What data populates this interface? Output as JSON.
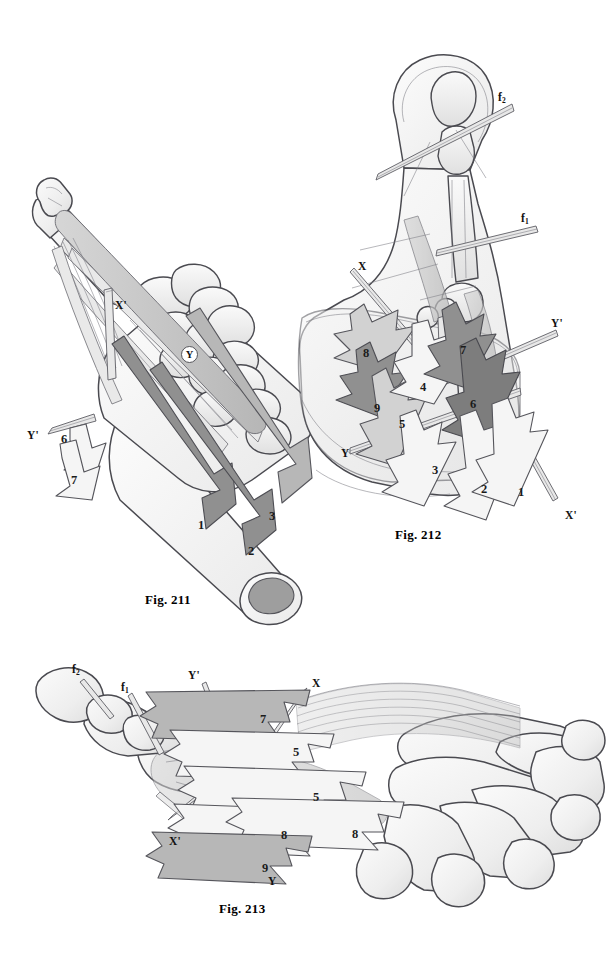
{
  "plate": {
    "background": "#ffffff",
    "ink": "#3a3a40",
    "palette": {
      "bone_fill": "#f2f2f2",
      "bone_shade": "#dcdcdc",
      "arrow_light": "#f4f4f4",
      "arrow_mid": "#cfcfcf",
      "arrow_grey": "#b4b4b4",
      "arrow_dark": "#8d8d8d",
      "arrow_darkest": "#7a7a7a",
      "tendon": "#e3e3e3",
      "outline": "#4a4a50",
      "pin": "#6f6f75"
    }
  },
  "figures": [
    {
      "id": "fig-211",
      "caption": "Fig. 211",
      "caption_pos": {
        "x": 145,
        "y": 592
      },
      "view": "dorsal oblique view of hand / metacarpal column with muscle force vectors",
      "axis_labels": [
        {
          "name": "X'",
          "text": "X'",
          "x": 115,
          "y": 300,
          "style": "plain"
        },
        {
          "name": "Y",
          "text": "Y",
          "x": 181,
          "y": 346,
          "style": "circled"
        },
        {
          "name": "Y'",
          "text": "Y'",
          "x": 27,
          "y": 430,
          "style": "plain"
        }
      ],
      "force_arrows": [
        {
          "label": "1",
          "x": 198,
          "y": 519,
          "tone": "arrow_dark"
        },
        {
          "label": "2",
          "x": 248,
          "y": 545,
          "tone": "arrow_dark"
        },
        {
          "label": "3",
          "x": 269,
          "y": 510,
          "tone": "arrow_grey"
        },
        {
          "label": "6",
          "x": 61,
          "y": 433,
          "tone": "arrow_light"
        },
        {
          "label": "7",
          "x": 71,
          "y": 474,
          "tone": "arrow_light"
        }
      ]
    },
    {
      "id": "fig-212",
      "caption": "Fig. 212",
      "caption_pos": {
        "x": 395,
        "y": 527
      },
      "view": "palmar view of thumb column showing nine force vectors and two rotation pins",
      "axis_labels": [
        {
          "name": "f2",
          "text": "f",
          "sub": "2",
          "x": 498,
          "y": 92,
          "style": "sub"
        },
        {
          "name": "f1",
          "text": "f",
          "sub": "1",
          "x": 521,
          "y": 213,
          "style": "sub"
        },
        {
          "name": "X",
          "text": "X",
          "x": 358,
          "y": 261,
          "style": "plain"
        },
        {
          "name": "Y'",
          "text": "Y'",
          "x": 551,
          "y": 318,
          "style": "plain"
        },
        {
          "name": "Y",
          "text": "Y",
          "x": 341,
          "y": 448,
          "style": "plain"
        },
        {
          "name": "X'",
          "text": "X'",
          "x": 565,
          "y": 510,
          "style": "plain"
        }
      ],
      "force_arrows": [
        {
          "label": "1",
          "x": 518,
          "y": 486,
          "tone": "arrow_light"
        },
        {
          "label": "2",
          "x": 481,
          "y": 483,
          "tone": "arrow_light"
        },
        {
          "label": "3",
          "x": 432,
          "y": 464,
          "tone": "arrow_light"
        },
        {
          "label": "4",
          "x": 420,
          "y": 381,
          "tone": "arrow_light"
        },
        {
          "label": "5",
          "x": 399,
          "y": 418,
          "tone": "arrow_mid"
        },
        {
          "label": "6",
          "x": 470,
          "y": 398,
          "tone": "arrow_darkest"
        },
        {
          "label": "7",
          "x": 460,
          "y": 344,
          "tone": "arrow_dark"
        },
        {
          "label": "8",
          "x": 363,
          "y": 347,
          "tone": "arrow_mid"
        },
        {
          "label": "9",
          "x": 374,
          "y": 402,
          "tone": "arrow_dark"
        }
      ]
    },
    {
      "id": "fig-213",
      "caption": "Fig. 213",
      "caption_pos": {
        "x": 219,
        "y": 901
      },
      "view": "distal oblique view of metacarpal arch with thumb column vectors",
      "axis_labels": [
        {
          "name": "f2",
          "text": "f",
          "sub": "2",
          "x": 72,
          "y": 664,
          "style": "sub"
        },
        {
          "name": "f1",
          "text": "f",
          "sub": "1",
          "x": 121,
          "y": 682,
          "style": "sub"
        },
        {
          "name": "Y'",
          "text": "Y'",
          "x": 188,
          "y": 670,
          "style": "plain"
        },
        {
          "name": "X",
          "text": "X",
          "x": 312,
          "y": 678,
          "style": "plain"
        },
        {
          "name": "X'",
          "text": "X'",
          "x": 169,
          "y": 836,
          "style": "plain"
        },
        {
          "name": "Y",
          "text": "Y",
          "x": 268,
          "y": 876,
          "style": "plain"
        }
      ],
      "force_arrows": [
        {
          "label": "7",
          "x": 260,
          "y": 713,
          "tone": "arrow_grey"
        },
        {
          "label": "5",
          "x": 293,
          "y": 746,
          "tone": "arrow_light"
        },
        {
          "label": "5",
          "x": 313,
          "y": 791,
          "tone": "arrow_light"
        },
        {
          "label": "8",
          "x": 281,
          "y": 829,
          "tone": "arrow_light"
        },
        {
          "label": "8",
          "x": 352,
          "y": 828,
          "tone": "arrow_light"
        },
        {
          "label": "9",
          "x": 262,
          "y": 862,
          "tone": "arrow_grey"
        }
      ]
    }
  ]
}
